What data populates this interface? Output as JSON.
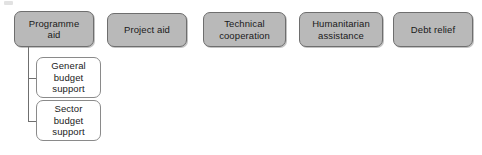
{
  "diagram": {
    "background_color": "#ffffff",
    "primary_fill": "#b9b9b9",
    "primary_border": "#6e6e6e",
    "secondary_fill": "#ffffff",
    "secondary_border": "#8a8a8a",
    "connector_color": "#6f6f6f",
    "text_color": "#1a1a1a",
    "top_level": [
      {
        "id": "programme-aid",
        "label": "Programme\naid",
        "x": 14,
        "y": 11,
        "w": 80,
        "h": 36
      },
      {
        "id": "project-aid",
        "label": "Project aid",
        "x": 107,
        "y": 13,
        "w": 80,
        "h": 34
      },
      {
        "id": "technical-cooperation",
        "label": "Technical\ncooperation",
        "x": 203,
        "y": 12,
        "w": 83,
        "h": 35
      },
      {
        "id": "humanitarian-assistance",
        "label": "Humanitarian\nassistance",
        "x": 299,
        "y": 12,
        "w": 84,
        "h": 35
      },
      {
        "id": "debt-relief",
        "label": "Debt relief",
        "x": 393,
        "y": 12,
        "w": 80,
        "h": 35
      }
    ],
    "sub_level": [
      {
        "id": "general-budget-support",
        "label": "General\nbudget\nsupport",
        "x": 36,
        "y": 57,
        "w": 65,
        "h": 41
      },
      {
        "id": "sector-budget-support",
        "label": "Sector\nbudget\nsupport",
        "x": 36,
        "y": 100,
        "w": 65,
        "h": 41
      }
    ],
    "connectors": {
      "trunk": {
        "x": 28,
        "y": 47,
        "h": 74
      },
      "branches": [
        {
          "id": "branch-general-budget-support",
          "x": 28,
          "y": 78,
          "w": 9
        },
        {
          "id": "branch-sector-budget-support",
          "x": 28,
          "y": 121,
          "w": 9
        }
      ]
    }
  }
}
